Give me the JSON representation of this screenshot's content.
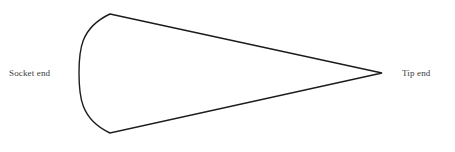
{
  "figure": {
    "name": "wedge-shape-diagram",
    "background_color": "#ffffff",
    "stroke_color": "#1c1c1c",
    "stroke_width": 1.4,
    "fill": "none",
    "label_color": "#3b3b3b"
  },
  "labels": {
    "socket_end": "Socket end",
    "tip_end": "Tip end"
  },
  "shape": {
    "type": "wedge",
    "description": "tapered wedge with concave curved left edge and pointed right apex",
    "vertices": {
      "top_corner": [
        110,
        14
      ],
      "bottom_corner": [
        110,
        133
      ],
      "tip_apex": [
        382,
        73
      ],
      "arc_leftmost": [
        79,
        73
      ]
    },
    "arc_control_points": {
      "upper": [
        80,
        28
      ],
      "lower": [
        80,
        119
      ]
    }
  }
}
